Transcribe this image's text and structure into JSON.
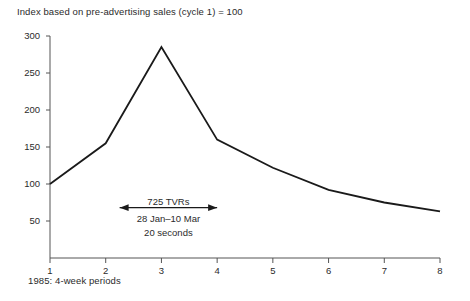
{
  "chart_data": {
    "type": "line",
    "title": "Index based on pre-advertising sales (cycle 1) = 100",
    "xlabel": "1985: 4-week periods",
    "ylabel": "",
    "categories": [
      "1",
      "2",
      "3",
      "4",
      "5",
      "6",
      "7",
      "8"
    ],
    "x": [
      1,
      2,
      3,
      4,
      5,
      6,
      7,
      8
    ],
    "values": [
      100,
      155,
      285,
      160,
      122,
      92,
      75,
      63
    ],
    "series": [
      {
        "name": "Sales index",
        "values": [
          100,
          155,
          285,
          160,
          122,
          92,
          75,
          63
        ]
      }
    ],
    "xlim": [
      1,
      8
    ],
    "ylim": [
      0,
      300
    ],
    "yticks": [
      50,
      100,
      150,
      200,
      250,
      300
    ],
    "ytick_labels": [
      "50",
      "100",
      "150",
      "200",
      "250",
      "300"
    ],
    "xticks": [
      1,
      2,
      3,
      4,
      5,
      6,
      7,
      8
    ],
    "xtick_labels": [
      "1",
      "2",
      "3",
      "4",
      "5",
      "6",
      "7",
      "8"
    ],
    "grid": false,
    "legend": false,
    "line_color": "#1a1a1a",
    "axis_color": "#555555",
    "annotations": [
      {
        "name": "campaign-span",
        "line1": "725 TVRs",
        "line2": "28 Jan–10 Mar",
        "line3": "20 seconds",
        "arrow_from_x": 2.25,
        "arrow_to_x": 4.0,
        "arrow_y_value": 68
      }
    ]
  },
  "axis": {
    "y_labels": [
      "300",
      "250",
      "200",
      "150",
      "100",
      "50"
    ],
    "x_labels": [
      "1",
      "2",
      "3",
      "4",
      "5",
      "6",
      "7",
      "8"
    ]
  },
  "annotation": {
    "tvrs": "725 TVRs",
    "dates": "28 Jan–10 Mar",
    "duration": "20 seconds"
  },
  "title": "Index based on pre-advertising sales (cycle 1) = 100",
  "caption": "1985: 4-week periods"
}
